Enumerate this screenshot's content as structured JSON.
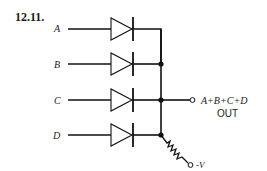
{
  "figure": {
    "number": "12.11."
  },
  "inputs": [
    {
      "label": "A",
      "y": 29
    },
    {
      "label": "B",
      "y": 64
    },
    {
      "label": "C",
      "y": 100
    },
    {
      "label": "D",
      "y": 135
    }
  ],
  "output": {
    "expression": "A+B+C+D",
    "name": "OUT"
  },
  "supply": {
    "label": "-V"
  },
  "components": {
    "diodes": 4,
    "resistor": 1,
    "type": "diode OR gate"
  }
}
